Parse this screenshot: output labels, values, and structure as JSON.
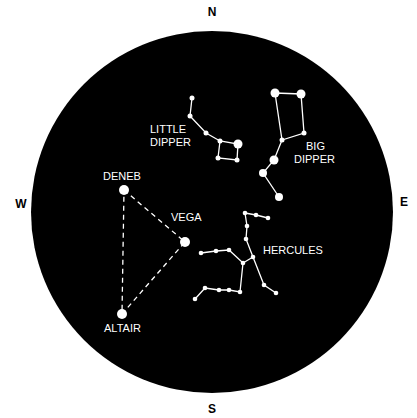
{
  "compass": {
    "n": "N",
    "s": "S",
    "e": "E",
    "w": "W"
  },
  "labels": {
    "little1": "LITTLE",
    "little2": "DIPPER",
    "big1": "BIG",
    "big2": "DIPPER",
    "deneb": "DENEB",
    "vega": "VEGA",
    "altair": "ALTAIR",
    "hercules": "HERCULES"
  },
  "colors": {
    "sky": "#000000",
    "star": "#ffffff"
  }
}
